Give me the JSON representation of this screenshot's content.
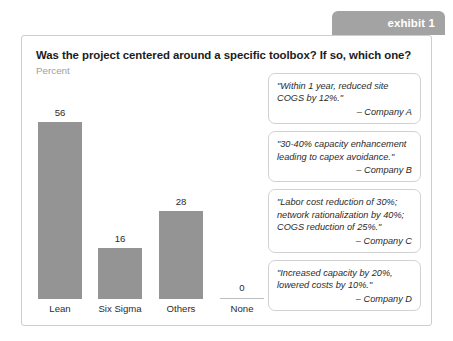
{
  "exhibit": {
    "tab_label": "exhibit 1",
    "tab_color": "#a3a3a3"
  },
  "card": {
    "title": "Was the project centered around a specific toolbox?  If so, which one?",
    "subtitle": "Percent",
    "border_color": "#cdcdcd",
    "background": "#ffffff"
  },
  "chart_data": {
    "type": "bar",
    "title": "Was the project centered around a specific toolbox?  If so, which one?",
    "subtitle": "Percent",
    "categories": [
      "Lean",
      "Six Sigma",
      "Others",
      "None"
    ],
    "values": [
      56,
      16,
      28,
      0
    ],
    "data_labels": [
      "56",
      "16",
      "28",
      "0"
    ],
    "xlabel": "",
    "ylabel": "Percent",
    "ylim": [
      0,
      60
    ],
    "grid": false,
    "legend": false,
    "bar_color": "#949494",
    "zero_line_color": "#bdbdbd"
  },
  "quotes": [
    {
      "text": "\"Within 1 year, reduced site COGS by 12%.\"",
      "attribution": "– Company A"
    },
    {
      "text": "\"30-40% capacity enhancement leading to capex avoidance.\"",
      "attribution": "– Company B"
    },
    {
      "text": "\"Labor cost reduction of 30%; network rationalization by 40%; COGS reduction of 25%.\"",
      "attribution": "– Company C"
    },
    {
      "text": "\"Increased capacity by 20%, lowered costs by 10%.\"",
      "attribution": "– Company D"
    }
  ]
}
